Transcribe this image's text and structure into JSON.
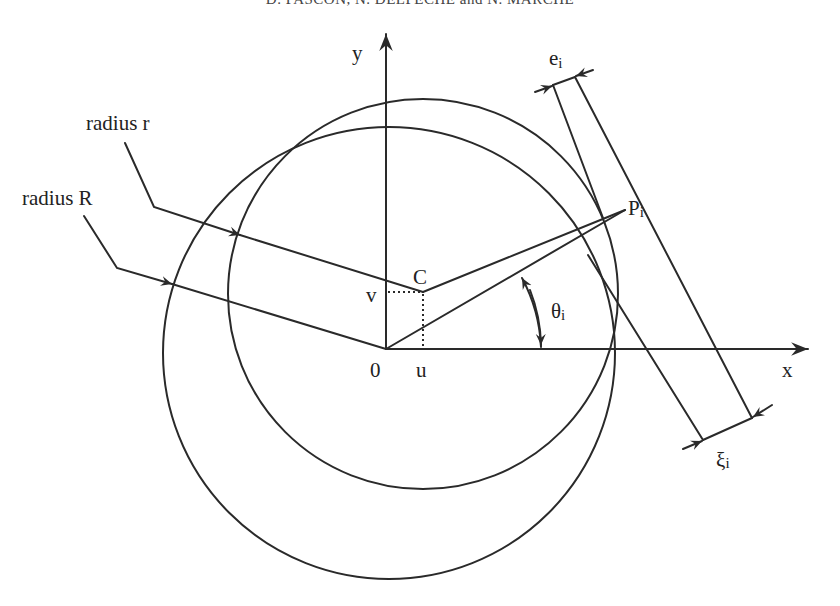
{
  "header": {
    "running_title": "D. PASCON, N. DELPECHE and N. MARCHE"
  },
  "diagram": {
    "axes": {
      "x_label": "x",
      "y_label": "y",
      "origin_label": "0"
    },
    "center": {
      "label": "C",
      "u_label": "u",
      "v_label": "v"
    },
    "circles": [
      {
        "name": "radius-r-circle",
        "label": "radius r"
      },
      {
        "name": "radius-R-circle",
        "label": "radius R"
      }
    ],
    "point": {
      "label": "P",
      "subscript": "i"
    },
    "angle": {
      "label": "θ",
      "subscript": "i"
    },
    "dimensions": [
      {
        "label": "e",
        "subscript": "i"
      },
      {
        "label": "ξ",
        "subscript": "i"
      }
    ]
  }
}
